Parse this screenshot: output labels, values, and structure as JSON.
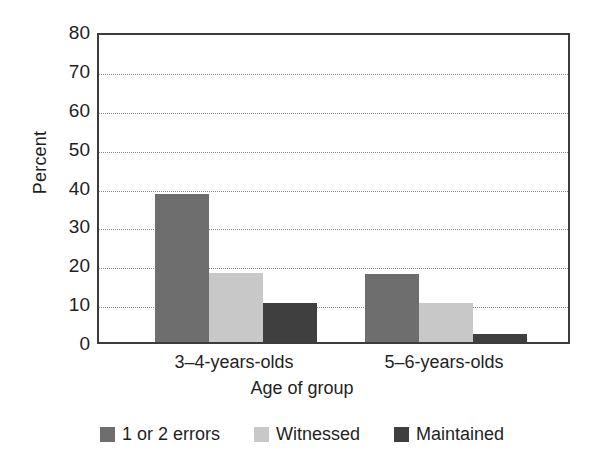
{
  "chart_data": {
    "type": "bar",
    "title": "",
    "xlabel": "Age of group",
    "ylabel": "Percent",
    "categories": [
      "3–4-years-olds",
      "5–6-years-olds"
    ],
    "series": [
      {
        "name": "1 or 2 errors",
        "values": [
          38,
          17.5
        ],
        "color": "#6e6e6e"
      },
      {
        "name": "Witnessed",
        "values": [
          17.8,
          10
        ],
        "color": "#c8c8c8"
      },
      {
        "name": "Maintained",
        "values": [
          10,
          2
        ],
        "color": "#3f3f3f"
      }
    ],
    "ylim": [
      0,
      80
    ],
    "yticks": [
      0,
      10,
      20,
      30,
      40,
      50,
      60,
      70,
      80
    ],
    "ytick_labels": [
      "0",
      "10",
      "20",
      "30",
      "40",
      "50",
      "60",
      "70",
      "80"
    ],
    "grid": "horizontal-dotted",
    "legend_position": "bottom-center"
  }
}
